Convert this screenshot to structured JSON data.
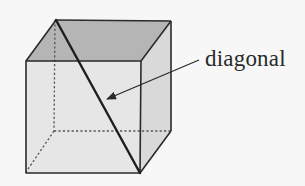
{
  "diagram": {
    "type": "cube-with-space-diagonal",
    "label": "diagonal",
    "colors": {
      "background": "#f7f7f7",
      "top_face": "#b5b5b5",
      "front_face": "#e6e6e6",
      "right_face": "#d9d9d9",
      "edge": "#2a2a2a",
      "hidden_edge": "#555555"
    },
    "vertices": {
      "front_top_left": [
        26,
        61
      ],
      "front_top_right": [
        141,
        61
      ],
      "front_bottom_left": [
        26,
        173
      ],
      "front_bottom_right": [
        140,
        173
      ],
      "back_top_left": [
        56,
        20
      ],
      "back_top_right": [
        171,
        21
      ],
      "back_bottom_right": [
        171,
        131
      ],
      "back_bottom_left": [
        54,
        131
      ]
    },
    "diagonal": {
      "from": "back_top_left",
      "to": "front_bottom_right"
    },
    "arrow": {
      "from": [
        199,
        60
      ],
      "to": [
        106,
        99
      ]
    }
  }
}
